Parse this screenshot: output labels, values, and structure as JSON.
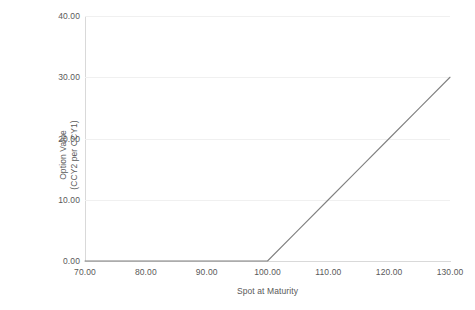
{
  "chart_data": {
    "type": "line",
    "title": "",
    "xlabel": "Spot at Maturity",
    "ylabel": "Option Value\n(CCY2 per CCY1)",
    "ylabel_line1": "Option Value",
    "ylabel_line2": "(CCY2 per CCY1)",
    "xlim": [
      70,
      130
    ],
    "ylim": [
      0,
      40
    ],
    "xticks": [
      70,
      80,
      90,
      100,
      110,
      120,
      130
    ],
    "yticks": [
      0,
      10,
      20,
      30,
      40
    ],
    "xtick_labels": [
      "70.00",
      "80.00",
      "90.00",
      "100.00",
      "110.00",
      "120.00",
      "130.00"
    ],
    "ytick_labels": [
      "0.00",
      "10.00",
      "20.00",
      "30.00",
      "40.00"
    ],
    "grid": true,
    "grid_axis": "y",
    "legend": false,
    "legend_position": "none",
    "line_color": "#808080",
    "grid_color": "#f0f0f0",
    "axis_color": "#d9d9d9",
    "text_color": "#595959",
    "background": "#ffffff",
    "series": [
      {
        "name": "Option Value",
        "x": [
          70,
          75,
          80,
          85,
          90,
          95,
          100,
          105,
          110,
          115,
          120,
          125,
          130
        ],
        "values": [
          0,
          0,
          0,
          0,
          0,
          0,
          0,
          5,
          10,
          15,
          20,
          25,
          30
        ]
      }
    ],
    "annotations": [
      {
        "label": "strike",
        "x": 100,
        "y": 0
      }
    ]
  }
}
